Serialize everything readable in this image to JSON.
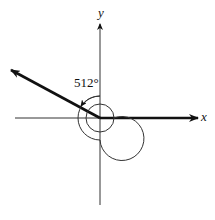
{
  "diagram": {
    "type": "angle-in-standard-position",
    "axes": {
      "x_label": "x",
      "y_label": "y"
    },
    "angle": {
      "label": "512°",
      "degrees": 512,
      "terminal_side_degrees": 152,
      "rotations": "one full counterclockwise revolution plus 152°"
    },
    "colors": {
      "stroke": "#111111",
      "background": "#ffffff"
    }
  }
}
